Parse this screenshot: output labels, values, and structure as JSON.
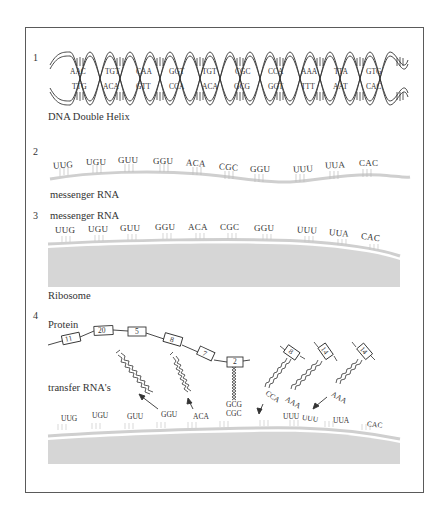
{
  "panels": {
    "p1": {
      "number": "1",
      "label": "DNA Double Helix",
      "top_strand": [
        "AAC",
        "TGT",
        "CAA",
        "GGT",
        "TGT",
        "CGC",
        "CCA",
        "AAA",
        "TTA",
        "GTG"
      ],
      "bottom_strand": [
        "TTG",
        "ACA",
        "GTT",
        "CCA",
        "ACA",
        "GCG",
        "GGT",
        "TTT",
        "AAT",
        "CAC"
      ]
    },
    "p2": {
      "number": "2",
      "label": "messenger RNA",
      "codons": [
        "UUG",
        "UGU",
        "GUU",
        "GGU",
        "ACA",
        "CGC",
        "GGU",
        "UUU",
        "UUA",
        "CAC"
      ]
    },
    "p3": {
      "number": "3",
      "label_top": "messenger RNA",
      "label_bottom": "Ribosome",
      "codons": [
        "UUG",
        "UGU",
        "GUU",
        "GGU",
        "ACA",
        "CGC",
        "GGU",
        "UUU",
        "UUA",
        "CAC"
      ]
    },
    "p4": {
      "number": "4",
      "protein_label": "Protein",
      "trna_label": "transfer RNA's",
      "protein_chain": [
        "11",
        "20",
        "5",
        "8",
        "7",
        "2"
      ],
      "free_trna_amino_acids": [
        "8",
        "14",
        "14"
      ],
      "anticodons": [
        "GCG",
        "CCA",
        "AAA",
        "AAA"
      ],
      "codons": [
        "UUG",
        "UGU",
        "GUU",
        "GGU",
        "ACA",
        "CGC",
        "UUU",
        "UUU",
        "UUA",
        "CAC"
      ]
    }
  }
}
